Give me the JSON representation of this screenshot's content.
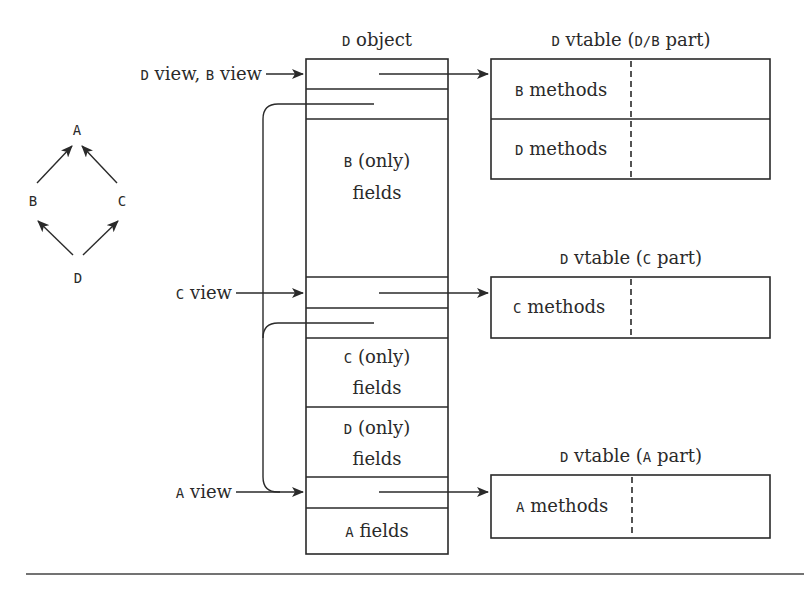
{
  "hierarchy": {
    "nodes": [
      {
        "id": "A",
        "label": "A"
      },
      {
        "id": "B",
        "label": "B"
      },
      {
        "id": "C",
        "label": "C"
      },
      {
        "id": "D",
        "label": "D"
      }
    ],
    "edges": [
      {
        "from": "B",
        "to": "A"
      },
      {
        "from": "C",
        "to": "A"
      },
      {
        "from": "D",
        "to": "B"
      },
      {
        "from": "D",
        "to": "C"
      }
    ]
  },
  "object": {
    "title_code": "D",
    "title_text": " object",
    "rows": [
      {
        "id": "vptr-db",
        "code": "",
        "text": "",
        "text2": ""
      },
      {
        "id": "vbptr-b",
        "code": "",
        "text": "",
        "text2": ""
      },
      {
        "id": "b-fields",
        "code": "B",
        "text": " (only)",
        "text2": "fields"
      },
      {
        "id": "vptr-c",
        "code": "",
        "text": "",
        "text2": ""
      },
      {
        "id": "vbptr-c",
        "code": "",
        "text": "",
        "text2": ""
      },
      {
        "id": "c-fields",
        "code": "C",
        "text": " (only)",
        "text2": "fields"
      },
      {
        "id": "d-fields",
        "code": "D",
        "text": " (only)",
        "text2": "fields"
      },
      {
        "id": "vptr-a",
        "code": "",
        "text": "",
        "text2": ""
      },
      {
        "id": "a-fields",
        "code": "A",
        "text": " fields",
        "text2": ""
      }
    ]
  },
  "views": [
    {
      "id": "db-view",
      "code1": "D",
      "text1": " view, ",
      "code2": "B",
      "text2": " view"
    },
    {
      "id": "c-view",
      "code1": "C",
      "text1": " view",
      "code2": "",
      "text2": ""
    },
    {
      "id": "a-view",
      "code1": "A",
      "text1": " view",
      "code2": "",
      "text2": ""
    }
  ],
  "vtables": [
    {
      "id": "vtable-db",
      "title": {
        "code1": "D",
        "t1": " vtable (",
        "code2": "D/B",
        "t2": " part)"
      },
      "rows": [
        {
          "code": "B",
          "text": " methods"
        },
        {
          "code": "D",
          "text": " methods"
        }
      ]
    },
    {
      "id": "vtable-c",
      "title": {
        "code1": "D",
        "t1": " vtable (",
        "code2": "C",
        "t2": " part)"
      },
      "rows": [
        {
          "code": "C",
          "text": " methods"
        }
      ]
    },
    {
      "id": "vtable-a",
      "title": {
        "code1": "D",
        "t1": " vtable (",
        "code2": "A",
        "t2": " part)"
      },
      "rows": [
        {
          "code": "A",
          "text": " methods"
        }
      ]
    }
  ],
  "colors": {
    "stroke": "#2a2a2a",
    "background": "#ffffff"
  }
}
